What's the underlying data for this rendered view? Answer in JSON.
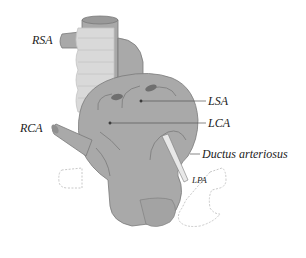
{
  "diagram": {
    "labels": {
      "rsa": "RSA",
      "rca": "RCA",
      "lsa": "LSA",
      "lca": "LCA",
      "ductus": "Ductus arteriosus",
      "lpa": "LPA"
    },
    "colors": {
      "vessel_fill": "#a9a9a9",
      "vessel_stroke": "#7a7a7a",
      "trachea_fill": "#d9d9d9",
      "trachea_ring": "#c4c4c4",
      "ductus_fill": "#e8e8e8",
      "pulmonary_outline": "#c8c8c8",
      "leader_line": "#555555",
      "label_text": "#222222"
    }
  }
}
